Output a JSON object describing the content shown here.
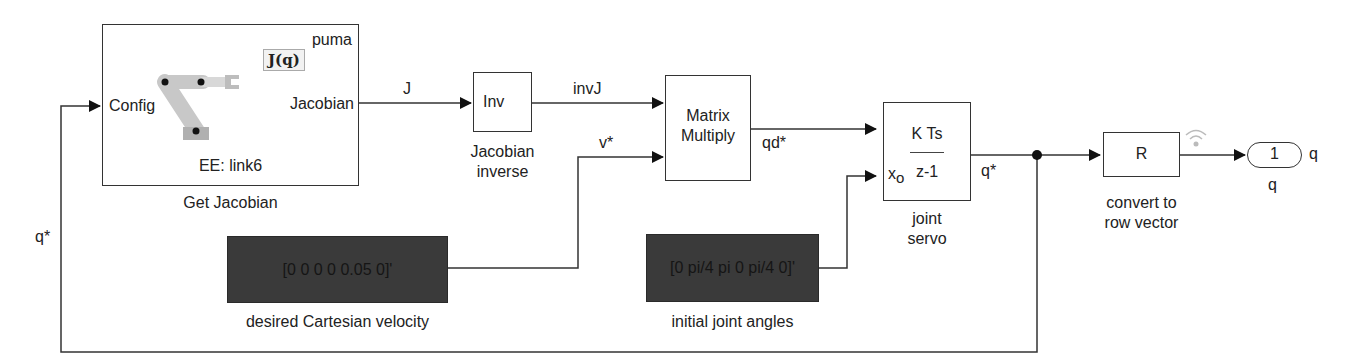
{
  "diagram": {
    "type": "simulink-block-diagram",
    "blocks": {
      "get_jacobian": {
        "name": "Get Jacobian",
        "input_port": "Config",
        "output_port": "Jacobian",
        "robot": "puma",
        "icon_text": "J(q)",
        "ee_label": "EE: link6"
      },
      "inv": {
        "text": "Inv",
        "name_line1": "Jacobian",
        "name_line2": "inverse"
      },
      "matmul": {
        "text_line1": "Matrix",
        "text_line2": "Multiply"
      },
      "servo": {
        "numerator": "K Ts",
        "denominator": "z-1",
        "x0_label": "x",
        "x0_sub": "o",
        "name_line1": "joint",
        "name_line2": "servo"
      },
      "row": {
        "text": "R",
        "name_line1": "convert to",
        "name_line2": "row vector"
      },
      "outport": {
        "number": "1",
        "side_label": "q",
        "name": "q"
      },
      "const_velocity": {
        "value": "[0 0 0 0 0.05 0]'",
        "name": "desired Cartesian velocity"
      },
      "const_angles": {
        "value": "[0 pi/4 pi  0 pi/4 0]'",
        "name": "initial joint angles"
      }
    },
    "signals": {
      "J": "J",
      "invJ": "invJ",
      "v": "v*",
      "qd": "qd*",
      "q_out": "q*",
      "q_feedback": "q*"
    },
    "colors": {
      "line": "#333333",
      "const_fill": "#3a3a3a",
      "arm": "#c8c8c8",
      "arm_base": "#b0b0b0"
    }
  }
}
